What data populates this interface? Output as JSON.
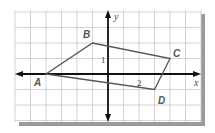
{
  "diagram": {
    "type": "coordinate-plane-quadrilateral",
    "grid": {
      "x_min": -6,
      "x_max": 6,
      "y_min": -3,
      "y_max": 4,
      "unit_px": 15.5
    },
    "axes": {
      "x_label": "x",
      "y_label": "y"
    },
    "tick_labels": [
      {
        "axis": "y",
        "value": 1,
        "text": "1"
      },
      {
        "axis": "x",
        "value": 2,
        "text": "2"
      }
    ],
    "vertices": [
      {
        "label": "A",
        "x": -4,
        "y": 0
      },
      {
        "label": "B",
        "x": -1,
        "y": 2
      },
      {
        "label": "C",
        "x": 4,
        "y": 1
      },
      {
        "label": "D",
        "x": 3,
        "y": -1
      }
    ],
    "colors": {
      "grid": "#c8c8c8",
      "axis": "#111111",
      "polygon": "#555555",
      "shadow": "#9a9a9a"
    }
  }
}
